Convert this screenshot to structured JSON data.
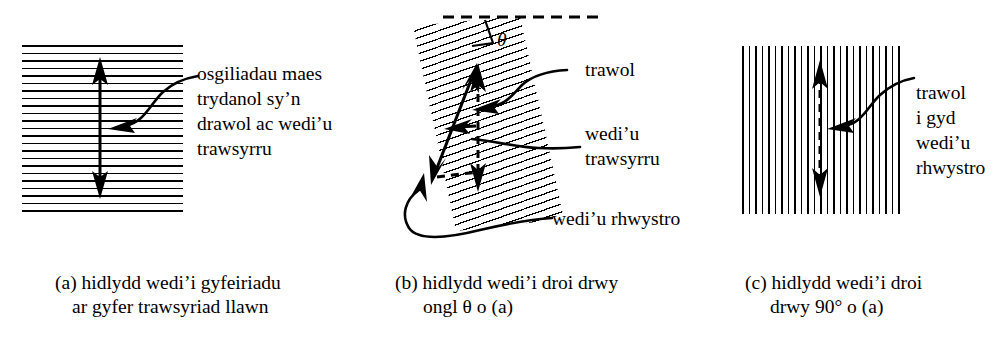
{
  "figure": {
    "background_color": "#ffffff",
    "ink_color": "#000000",
    "panels": [
      {
        "id": "a",
        "name": "oriented-filter",
        "hatch_orientation": "horizontal",
        "hatch_line_count": 23,
        "arrow_style": "solid",
        "arrow_orientation": "vertical",
        "caption_lines": [
          "(a) hidlydd wedi’i gyfeiriadu",
          "ar gyfer trawsyriad llawn"
        ],
        "annotations": [
          {
            "name": "transmitted-field-label",
            "lines": [
              "osgiliadau maes",
              "trydanol sy’n",
              "drawol ac wedi’u",
              "trawsyrru"
            ],
            "italic_word": "ac"
          }
        ]
      },
      {
        "id": "b",
        "name": "rotated-filter",
        "hatch_orientation": "tilted",
        "rotation_symbol": "θ",
        "hatch_line_count": 24,
        "caption_lines": [
          "(b) hidlydd wedi’i droi drwy",
          "ongl θ o (a)"
        ],
        "annotations": [
          {
            "name": "incident-label",
            "lines": [
              "trawol"
            ]
          },
          {
            "name": "transmitted-label",
            "lines": [
              "wedi’u",
              "trawsyrru"
            ]
          },
          {
            "name": "blocked-label",
            "lines": [
              "wedi’u rhwystro"
            ]
          }
        ]
      },
      {
        "id": "c",
        "name": "crossed-filter",
        "hatch_orientation": "vertical",
        "hatch_line_count": 25,
        "arrow_style": "dashed",
        "arrow_orientation": "vertical",
        "caption_lines": [
          "(c) hidlydd wedi’i droi",
          "drwy 90° o (a)"
        ],
        "annotations": [
          {
            "name": "all-blocked-label",
            "lines": [
              "trawol",
              "i gyd",
              "wedi’u",
              "rhwystro"
            ]
          }
        ]
      }
    ]
  },
  "panel_a": {
    "label_line_1": "osgiliadau maes",
    "label_line_2": "trydanol sy’n",
    "label_line_3a": "drawol ",
    "label_line_3b": "ac",
    "label_line_3c": " wedi’u",
    "label_line_4": "trawsyrru",
    "caption_line_1": "(a) hidlydd wedi’i gyfeiriadu",
    "caption_line_2": "ar gyfer trawsyriad llawn"
  },
  "panel_b": {
    "theta_symbol": "θ",
    "label_incident": "trawol",
    "label_transmitted_1": "wedi’u",
    "label_transmitted_2": "trawsyrru",
    "label_blocked": "wedi’u rhwystro",
    "caption_line_1": "(b) hidlydd wedi’i droi drwy",
    "caption_line_2a": "ongl ",
    "caption_line_2b": "θ",
    "caption_line_2c": " o (a)"
  },
  "panel_c": {
    "label_line_1": "trawol",
    "label_line_2": "i gyd",
    "label_line_3": "wedi’u",
    "label_line_4": "rhwystro",
    "caption_line_1": "(c) hidlydd wedi’i droi",
    "caption_line_2": "drwy 90° o (a)"
  }
}
